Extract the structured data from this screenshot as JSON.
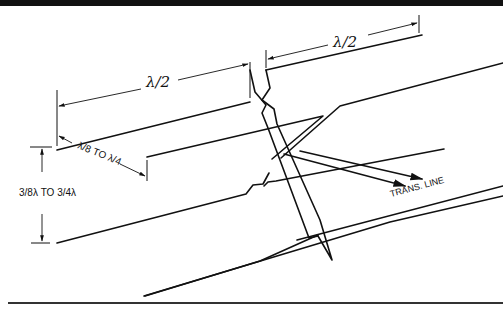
{
  "figure": {
    "type": "antenna-element-diagram",
    "labels": {
      "top_half_wave": "λ/2",
      "left_half_wave": "λ/2",
      "spacing_small": "λ/8 TO λ/4",
      "spacing_small_parts": {
        "num1": "λ",
        "den1": "8",
        "to": "TO",
        "num2": "λ",
        "den2": "4"
      },
      "spacing_large": "3/8λ TO 3/4λ",
      "spacing_large_parts": {
        "num1": "3",
        "den1": "8",
        "lam1": "λ",
        "to": "TO",
        "num2": "3",
        "den2": "4",
        "lam2": "λ"
      },
      "feed": "TRANS. LINE"
    },
    "colors": {
      "ink": "#111111",
      "background": "#ffffff"
    }
  }
}
